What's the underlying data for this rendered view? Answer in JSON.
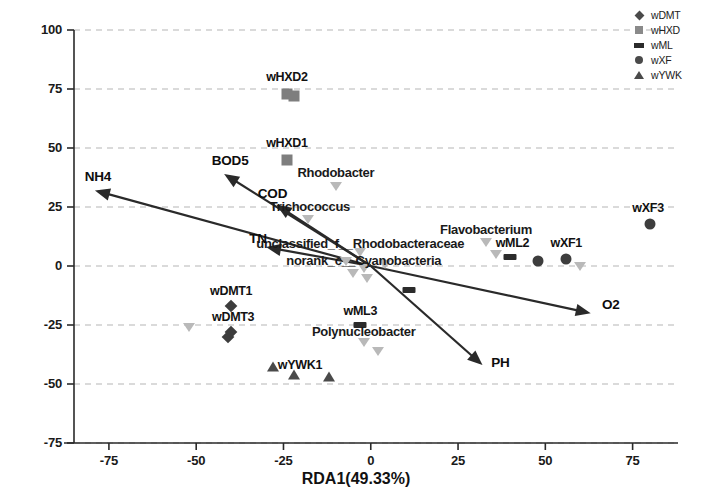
{
  "chart_data": {
    "type": "scatter",
    "title": "",
    "xlabel": "RDA1(49.33%)",
    "ylabel": "RDA2(23.86%)",
    "xlim": [
      -85,
      88
    ],
    "ylim": [
      -75,
      100
    ],
    "xticks": [
      -75,
      -50,
      -25,
      0,
      25,
      50,
      75
    ],
    "yticks": [
      -75,
      -50,
      -25,
      0,
      25,
      50,
      75,
      100
    ],
    "xtick_labels": [
      "-75",
      "-50",
      "-25",
      "0",
      "25",
      "50",
      "75"
    ],
    "ytick_labels": [
      "-75",
      "-50",
      "-25",
      "0",
      "25",
      "50",
      "75",
      "100"
    ],
    "grid": true,
    "grid_style": "dashed",
    "legend_position": "top-right",
    "legend": [
      {
        "label": "wDMT",
        "marker": "diamond"
      },
      {
        "label": "wHXD",
        "marker": "square"
      },
      {
        "label": "wML",
        "marker": "dash"
      },
      {
        "label": "wXF",
        "marker": "circle"
      },
      {
        "label": "wYWK",
        "marker": "triangle"
      }
    ],
    "samples": [
      {
        "label": "wHXD2",
        "x": -24,
        "y": 73,
        "marker": "square",
        "label_dx": 0,
        "label_dy": 17
      },
      {
        "label": "wHXD1",
        "x": -24,
        "y": 45,
        "marker": "square",
        "label_dx": 0,
        "label_dy": 17
      },
      {
        "label": "wXF3",
        "x": 80,
        "y": 18,
        "marker": "circle",
        "label_dx": -2,
        "label_dy": 16
      },
      {
        "label": "wXF1",
        "x": 56,
        "y": 3,
        "marker": "circle",
        "label_dx": 0,
        "label_dy": 16
      },
      {
        "label": "wML2",
        "x": 40,
        "y": 4,
        "marker": "dash",
        "label_dx": 2,
        "label_dy": 14
      },
      {
        "label": "wDMT1",
        "x": -40,
        "y": -17,
        "marker": "diamond",
        "label_dx": 0,
        "label_dy": 15
      },
      {
        "label": "wDMT3",
        "x": -40,
        "y": -28,
        "marker": "diamond",
        "label_dx": 2,
        "label_dy": 15
      },
      {
        "label": "wML3",
        "x": -3,
        "y": -25,
        "marker": "dash",
        "label_dx": 0,
        "label_dy": 14
      },
      {
        "label": "wYWK1",
        "x": -28,
        "y": -43,
        "marker": "triangle",
        "label_dx": 27,
        "label_dy": 2
      }
    ],
    "sample_points_unlabeled": [
      {
        "x": -22,
        "y": 72,
        "marker": "square"
      },
      {
        "x": 48,
        "y": 2,
        "marker": "circle"
      },
      {
        "x": -41,
        "y": -30,
        "marker": "diamond"
      },
      {
        "x": 11,
        "y": -10,
        "marker": "dash"
      },
      {
        "x": -22,
        "y": -46,
        "marker": "triangle"
      },
      {
        "x": -12,
        "y": -47,
        "marker": "triangle"
      }
    ],
    "species": [
      {
        "label": "Rhodobacter",
        "x": -10,
        "y": 34,
        "label_dx": 0,
        "label_dy": 14
      },
      {
        "label": "Trichococcus",
        "x": -18,
        "y": 20,
        "label_dx": 2,
        "label_dy": 13
      },
      {
        "label": "unclassified_f__Rhodobacteraceae",
        "x": -3,
        "y": 6,
        "label_dx": 0,
        "label_dy": 9
      },
      {
        "label": "norank_c__Cyanobacteria",
        "x": -2,
        "y": -1,
        "label_dx": 0,
        "label_dy": 8
      },
      {
        "label": "Flavobacterium",
        "x": 33,
        "y": 10,
        "label_dx": 0,
        "label_dy": 13
      },
      {
        "label": "Polynucleobacter",
        "x": -2,
        "y": -32,
        "label_dx": 0,
        "label_dy": 11
      }
    ],
    "species_points_unlabeled": [
      {
        "x": -52,
        "y": -26
      },
      {
        "x": -7,
        "y": 2
      },
      {
        "x": -5,
        "y": -3
      },
      {
        "x": -1,
        "y": -5
      },
      {
        "x": 4,
        "y": 1
      },
      {
        "x": 60,
        "y": 0
      },
      {
        "x": 36,
        "y": 5
      },
      {
        "x": 2,
        "y": -36
      }
    ],
    "env_vectors": [
      {
        "label": "NH4",
        "x": -79,
        "y": 32,
        "label_dx": 3,
        "label_dy": 14
      },
      {
        "label": "BOD5",
        "x": -42,
        "y": 39,
        "label_dx": 6,
        "label_dy": 14
      },
      {
        "label": "COD",
        "x": -27,
        "y": 26,
        "label_dx": -4,
        "label_dy": 12
      },
      {
        "label": "TN",
        "x": -30,
        "y": 8,
        "label_dx": -8,
        "label_dy": 9
      },
      {
        "label": "O2",
        "x": 63,
        "y": -20,
        "label_dx": 20,
        "label_dy": 9
      },
      {
        "label": "PH",
        "x": 32,
        "y": -42,
        "label_dx": 18,
        "label_dy": 3
      }
    ],
    "colors": {
      "sample_dark": "#3d3d3d",
      "sample_gray": "#7e7e7e",
      "species_gray": "#b9b9b9",
      "arrow": "#2a2a2a",
      "grid": "#b5b5b5",
      "axis": "#2a2a2a"
    }
  }
}
